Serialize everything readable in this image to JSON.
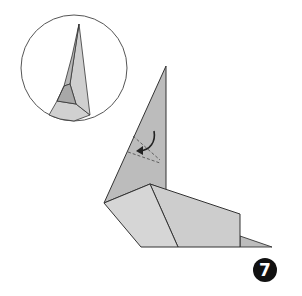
{
  "diagram": {
    "type": "origami-instruction-step",
    "step_number": "7",
    "colors": {
      "paper_light": "#d6d6d6",
      "paper_mid": "#c4c4c4",
      "paper_dark": "#b0b0b0",
      "outline": "#333333",
      "badge": "#111111"
    },
    "inset": {
      "description": "circular detail view of flap tip",
      "shape": "circle"
    },
    "main_model": {
      "description": "folded model with tall pointed flap and base, with fold arrow and dashed crease lines"
    },
    "annotations": {
      "fold_arrow": "curved arrow indicating fold",
      "crease_lines": "dashed valley-fold lines"
    }
  }
}
